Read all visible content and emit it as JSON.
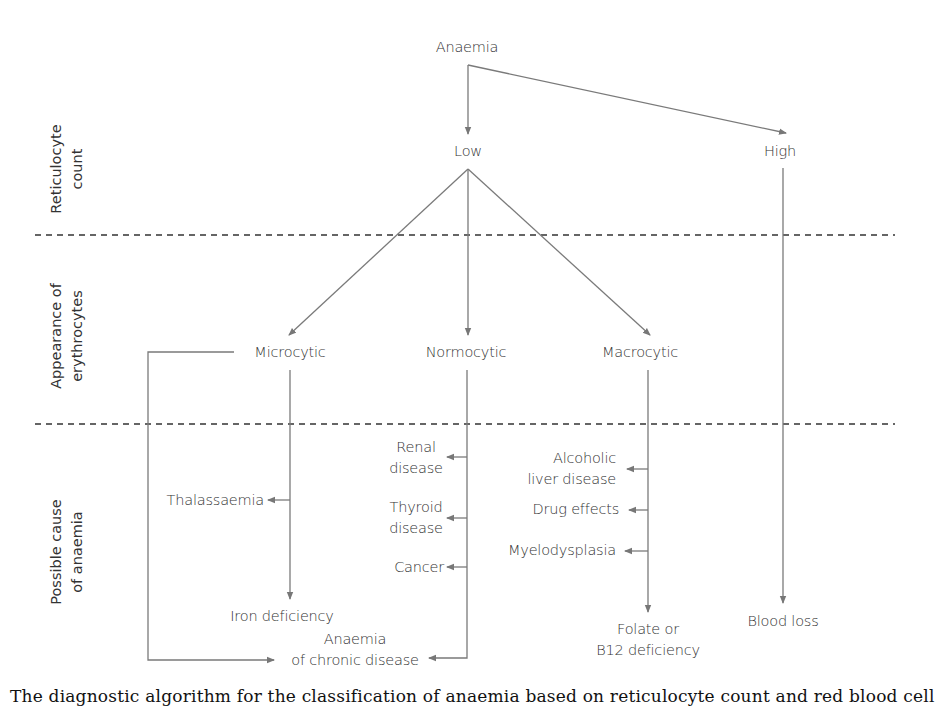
{
  "diagram": {
    "root": "Anaemia",
    "row_labels": {
      "reticulocyte": [
        "Reticulocyte",
        "count"
      ],
      "appearance": [
        "Appearance of",
        "erythrocytes"
      ],
      "cause": [
        "Possible cause",
        "of anaemia"
      ]
    },
    "reticulocyte_count": {
      "low": "Low",
      "high": "High"
    },
    "appearance": {
      "microcytic": "Microcytic",
      "normocytic": "Normocytic",
      "macrocytic": "Macrocytic"
    },
    "causes": {
      "thalassaemia": "Thalassaemia",
      "iron_deficiency": "Iron deficiency",
      "renal": [
        "Renal",
        "disease"
      ],
      "thyroid": [
        "Thyroid",
        "disease"
      ],
      "cancer": "Cancer",
      "chronic_disease": [
        "Anaemia",
        "of chronic disease"
      ],
      "alcoholic_liver": [
        "Alcoholic",
        "liver disease"
      ],
      "drug_effects": "Drug effects",
      "myelodysplasia": "Myelodysplasia",
      "folate_b12": [
        "Folate or",
        "B12 deficiency"
      ],
      "blood_loss": "Blood loss"
    },
    "edges": [
      {
        "from": "Anaemia",
        "to": "Low"
      },
      {
        "from": "Anaemia",
        "to": "High"
      },
      {
        "from": "Low",
        "to": "Microcytic"
      },
      {
        "from": "Low",
        "to": "Normocytic"
      },
      {
        "from": "Low",
        "to": "Macrocytic"
      },
      {
        "from": "High",
        "to": "Blood loss"
      },
      {
        "from": "Microcytic",
        "to": "Thalassaemia"
      },
      {
        "from": "Microcytic",
        "to": "Iron deficiency"
      },
      {
        "from": "Microcytic",
        "to": "Anaemia of chronic disease"
      },
      {
        "from": "Normocytic",
        "to": "Renal disease"
      },
      {
        "from": "Normocytic",
        "to": "Thyroid disease"
      },
      {
        "from": "Normocytic",
        "to": "Cancer"
      },
      {
        "from": "Normocytic",
        "to": "Anaemia of chronic disease"
      },
      {
        "from": "Macrocytic",
        "to": "Alcoholic liver disease"
      },
      {
        "from": "Macrocytic",
        "to": "Drug effects"
      },
      {
        "from": "Macrocytic",
        "to": "Myelodysplasia"
      },
      {
        "from": "Macrocytic",
        "to": "Folate or B12 deficiency"
      }
    ],
    "colors": {
      "line": "#7a7a7a",
      "dashed": "#333333",
      "text": "#333333"
    }
  },
  "caption": {
    "partial_text": "The diagnostic algorithm for the classification of anaemia based on reticulocyte count and red blood cell"
  }
}
